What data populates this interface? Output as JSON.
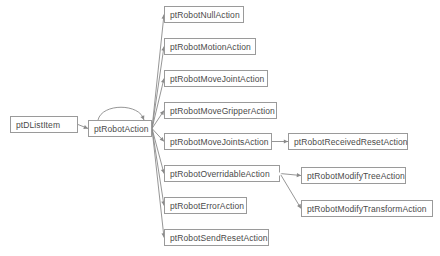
{
  "diagram": {
    "background": "#ffffff",
    "node_border_color": "#9a9a9a",
    "node_text_color": "#4a4a4a",
    "edge_color": "#8a8a8a",
    "nodes": [
      {
        "id": "ptDListItem",
        "label": "ptDListItem",
        "x": 10,
        "y": 116,
        "w": 68,
        "expander": true
      },
      {
        "id": "ptRobotAction",
        "label": "ptRobotAction",
        "x": 88,
        "y": 120,
        "w": 64,
        "expander": false
      },
      {
        "id": "ptRobotNullAction",
        "label": "ptRobotNullAction",
        "x": 164,
        "y": 6,
        "w": 80,
        "expander": false
      },
      {
        "id": "ptRobotMotionAction",
        "label": "ptRobotMotionAction",
        "x": 164,
        "y": 38,
        "w": 92,
        "expander": false
      },
      {
        "id": "ptRobotMoveJointAction",
        "label": "ptRobotMoveJointAction",
        "x": 164,
        "y": 70,
        "w": 104,
        "expander": false
      },
      {
        "id": "ptRobotMoveGripperAction",
        "label": "ptRobotMoveGripperAction",
        "x": 164,
        "y": 102,
        "w": 113,
        "expander": false
      },
      {
        "id": "ptRobotMoveJointsAction",
        "label": "ptRobotMoveJointsAction",
        "x": 164,
        "y": 133,
        "w": 108,
        "expander": false
      },
      {
        "id": "ptRobotOverridableAction",
        "label": "ptRobotOverridableAction",
        "x": 164,
        "y": 165,
        "w": 116,
        "expander": true
      },
      {
        "id": "ptRobotErrorAction",
        "label": "ptRobotErrorAction",
        "x": 164,
        "y": 197,
        "w": 83,
        "expander": false
      },
      {
        "id": "ptRobotSendResetAction",
        "label": "ptRobotSendResetAction",
        "x": 164,
        "y": 229,
        "w": 105,
        "expander": false
      },
      {
        "id": "ptRobotReceivedResetAction",
        "label": "ptRobotReceivedResetAction",
        "x": 288,
        "y": 133,
        "w": 120,
        "expander": false
      },
      {
        "id": "ptRobotModifyTreeAction",
        "label": "ptRobotModifyTreeAction",
        "x": 301,
        "y": 167,
        "w": 105,
        "expander": false
      },
      {
        "id": "ptRobotModifyTransformAction",
        "label": "ptRobotModifyTransformAction",
        "x": 301,
        "y": 200,
        "w": 132,
        "expander": false
      }
    ],
    "edges": [
      {
        "from": "ptDListItem",
        "to": "ptRobotAction",
        "kind": "straight"
      },
      {
        "from": "ptRobotAction",
        "to": "ptRobotAction",
        "kind": "self-loop"
      },
      {
        "from": "ptRobotAction",
        "to": "ptRobotNullAction",
        "kind": "straight"
      },
      {
        "from": "ptRobotAction",
        "to": "ptRobotMotionAction",
        "kind": "straight"
      },
      {
        "from": "ptRobotAction",
        "to": "ptRobotMoveJointAction",
        "kind": "straight"
      },
      {
        "from": "ptRobotAction",
        "to": "ptRobotMoveGripperAction",
        "kind": "straight"
      },
      {
        "from": "ptRobotAction",
        "to": "ptRobotMoveJointsAction",
        "kind": "straight"
      },
      {
        "from": "ptRobotAction",
        "to": "ptRobotOverridableAction",
        "kind": "straight"
      },
      {
        "from": "ptRobotAction",
        "to": "ptRobotErrorAction",
        "kind": "straight"
      },
      {
        "from": "ptRobotAction",
        "to": "ptRobotSendResetAction",
        "kind": "straight"
      },
      {
        "from": "ptRobotMoveJointsAction",
        "to": "ptRobotReceivedResetAction",
        "kind": "straight"
      },
      {
        "from": "ptRobotOverridableAction",
        "to": "ptRobotModifyTreeAction",
        "kind": "straight"
      },
      {
        "from": "ptRobotOverridableAction",
        "to": "ptRobotModifyTransformAction",
        "kind": "straight"
      }
    ]
  }
}
